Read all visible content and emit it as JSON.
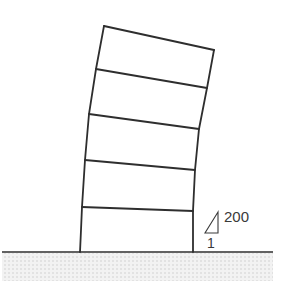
{
  "diagram": {
    "type": "building-drift",
    "stories": 5,
    "drift_ratio": {
      "rise": "200",
      "run": "1"
    },
    "colors": {
      "line": "#2e2e2e",
      "ground_hatch": "#e6e6e6",
      "background": "#ffffff"
    }
  }
}
